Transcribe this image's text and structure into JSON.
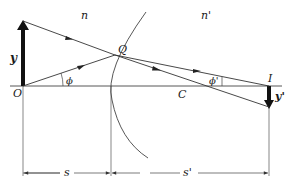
{
  "diagram": {
    "type": "refraction-at-spherical-surface",
    "labels": {
      "medium_left": "n",
      "medium_right": "n'",
      "object_point": "O",
      "object_height": "y",
      "refraction_point": "Q",
      "center_of_curvature": "C",
      "image_point": "I",
      "image_height": "y'",
      "angle_object": "ϕ",
      "angle_image": "ϕ'",
      "object_distance": "s",
      "image_distance": "s'"
    },
    "colors": {
      "line": "#2a2a2a",
      "arrow": "#111111",
      "background": "#ffffff"
    }
  }
}
